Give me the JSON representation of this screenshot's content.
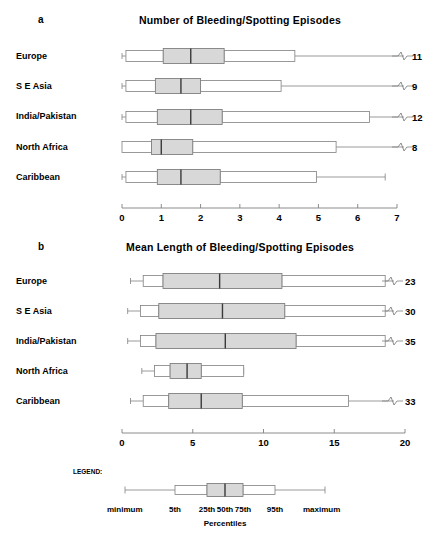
{
  "figure": {
    "panel_a_letter": "a",
    "panel_b_letter": "b"
  },
  "chart_data": [
    {
      "type": "boxplot",
      "panel": "a",
      "title": "Number of Bleeding/Spotting Episodes",
      "xlabel": "",
      "ylabel": "",
      "xlim": [
        0,
        7
      ],
      "xticks": [
        0,
        1,
        2,
        3,
        4,
        5,
        6,
        7
      ],
      "xticklabels": [
        "0",
        "1",
        "2",
        "3",
        "4",
        "5",
        "6",
        "7"
      ],
      "grid": false,
      "orientation": "horizontal",
      "percentile_keys": [
        "5th",
        "25th",
        "50th",
        "75th",
        "95th",
        "maximum"
      ],
      "categories": [
        "Europe",
        "S E Asia",
        "India/Pakistan",
        "North Africa",
        "Caribbean"
      ],
      "boxes": [
        {
          "category": "Europe",
          "p5": 0.1,
          "p25": 1.05,
          "p50": 1.75,
          "p75": 2.6,
          "p95": 4.4,
          "max": 11,
          "max_label": "11",
          "axis_break": true
        },
        {
          "category": "S E Asia",
          "p5": 0.1,
          "p25": 0.85,
          "p50": 1.5,
          "p75": 2.0,
          "p95": 4.05,
          "max": 9,
          "max_label": "9",
          "axis_break": true
        },
        {
          "category": "India/Pakistan",
          "p5": 0.1,
          "p25": 0.9,
          "p50": 1.75,
          "p75": 2.55,
          "p95": 6.3,
          "max": 12,
          "max_label": "12",
          "axis_break": true
        },
        {
          "category": "North Africa",
          "p5": 0.0,
          "p25": 0.75,
          "p50": 1.0,
          "p75": 1.8,
          "p95": 5.45,
          "max": 8,
          "max_label": "8",
          "axis_break": true
        },
        {
          "category": "Caribbean",
          "p5": 0.1,
          "p25": 0.9,
          "p50": 1.5,
          "p75": 2.5,
          "p95": 4.95,
          "max": 6.7,
          "max_label": "",
          "axis_break": false
        }
      ]
    },
    {
      "type": "boxplot",
      "panel": "b",
      "title": "Mean Length of Bleeding/Spotting Episodes",
      "xlabel": "",
      "ylabel": "",
      "xlim": [
        0,
        20
      ],
      "xticks": [
        0,
        5,
        10,
        15,
        20
      ],
      "xticklabels": [
        "0",
        "5",
        "10",
        "15",
        "20"
      ],
      "grid": false,
      "orientation": "horizontal",
      "percentile_keys": [
        "5th",
        "25th",
        "50th",
        "75th",
        "95th",
        "maximum"
      ],
      "categories": [
        "Europe",
        "S E Asia",
        "India/Pakistan",
        "North Africa",
        "Caribbean"
      ],
      "boxes": [
        {
          "category": "Europe",
          "p5": 1.5,
          "p25": 2.9,
          "p50": 6.9,
          "p75": 11.3,
          "p95": 18.6,
          "max": 23,
          "max_label": "23",
          "axis_break": true
        },
        {
          "category": "S E Asia",
          "p5": 1.3,
          "p25": 2.6,
          "p50": 7.1,
          "p75": 11.5,
          "p95": 18.6,
          "max": 30,
          "max_label": "30",
          "axis_break": true
        },
        {
          "category": "India/Pakistan",
          "p5": 1.3,
          "p25": 2.4,
          "p50": 7.3,
          "p75": 12.3,
          "p95": 18.6,
          "max": 35,
          "max_label": "35",
          "axis_break": true
        },
        {
          "category": "North Africa",
          "p5": 2.3,
          "p25": 3.4,
          "p50": 4.6,
          "p75": 5.6,
          "p95": 8.6,
          "max": 8.6,
          "max_label": "",
          "axis_break": false
        },
        {
          "category": "Caribbean",
          "p5": 1.5,
          "p25": 3.3,
          "p50": 5.6,
          "p75": 8.5,
          "p95": 16.0,
          "max": 33,
          "max_label": "33",
          "axis_break": true
        }
      ]
    }
  ],
  "legend": {
    "heading": "LEGEND:",
    "minimum_label": "minimum",
    "maximum_label": "maximum",
    "percentile_labels": [
      "5th",
      "25th",
      "50th",
      "75th",
      "95th"
    ],
    "axis_caption": "Percentiles"
  },
  "style": {
    "box_fill_shaded": "#d8d8d8",
    "box_fill_open": "#ffffff",
    "line_color": "#808080",
    "median_color": "#3a3a3a",
    "text_color": "#000000"
  }
}
